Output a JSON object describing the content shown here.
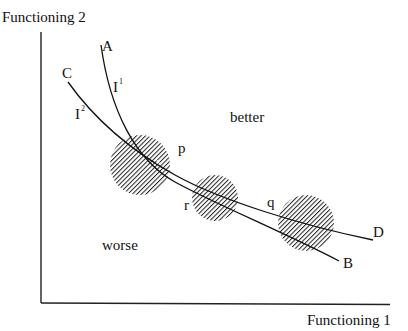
{
  "axes": {
    "y_label": "Functioning 2",
    "x_label": "Functioning 1"
  },
  "curves": [
    {
      "id": "I1",
      "name_label": "I",
      "name_sup": "1",
      "start_label": "A",
      "end_label": "B"
    },
    {
      "id": "I2",
      "name_label": "I",
      "name_sup": "2",
      "start_label": "C",
      "end_label": "D"
    }
  ],
  "points": [
    {
      "label": "p",
      "note": "x"
    },
    {
      "label": "r"
    },
    {
      "label": "q"
    }
  ],
  "regions": {
    "better": "better",
    "worse": "worse"
  },
  "colors": {
    "ink": "#111111",
    "hatch": "#222222",
    "background": "#ffffff"
  }
}
